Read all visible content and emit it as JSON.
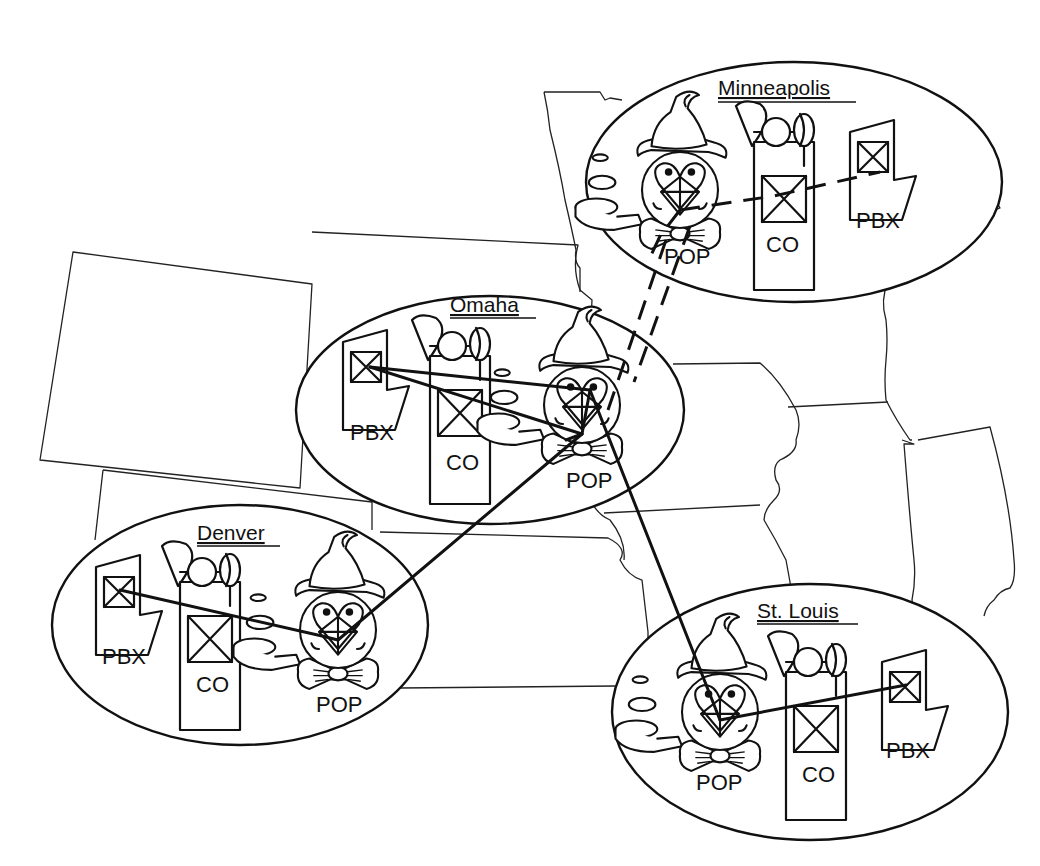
{
  "diagram": {
    "title": "",
    "colors": {
      "ink": "#111111",
      "background": "#ffffff"
    },
    "symbol_labels": {
      "pop": "POP",
      "co": "CO",
      "pbx": "PBX"
    },
    "sites": [
      {
        "id": "minneapolis",
        "name": "Minneapolis",
        "layout": "POP-CO-PBX"
      },
      {
        "id": "omaha",
        "name": "Omaha",
        "layout": "PBX-CO-POP"
      },
      {
        "id": "denver",
        "name": "Denver",
        "layout": "PBX-CO-POP"
      },
      {
        "id": "stlouis",
        "name": "St. Louis",
        "layout": "POP-CO-PBX"
      }
    ],
    "links": [
      {
        "from": "Minneapolis POP",
        "to": "Minneapolis PBX",
        "style": "dashed"
      },
      {
        "from": "Minneapolis POP",
        "to": "Omaha POP",
        "style": "dashed"
      },
      {
        "from": "Omaha PBX",
        "to": "Omaha POP",
        "style": "solid"
      },
      {
        "from": "Omaha PBX",
        "to": "Omaha POP (lower)",
        "style": "solid"
      },
      {
        "from": "Omaha POP",
        "to": "Denver POP",
        "style": "solid"
      },
      {
        "from": "Omaha POP",
        "to": "St. Louis POP",
        "style": "solid"
      },
      {
        "from": "Denver PBX",
        "to": "Denver POP",
        "style": "solid"
      },
      {
        "from": "St. Louis POP",
        "to": "St. Louis PBX",
        "style": "solid"
      }
    ],
    "icons": {
      "pop": "pop-mascot-icon",
      "co": "central-office-icon",
      "pbx": "pbx-switch-icon"
    }
  }
}
